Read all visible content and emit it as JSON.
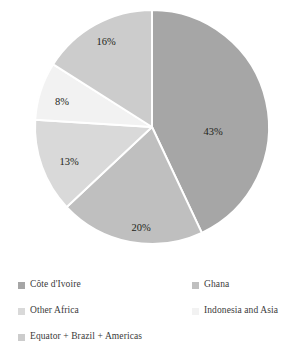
{
  "chart_data": {
    "type": "pie",
    "title": "",
    "subtitle": "",
    "xlabel": "",
    "ylabel": "",
    "grid": false,
    "legend_position": "bottom",
    "start_angle_deg": 0,
    "direction": "clockwise",
    "categories": [
      "Côte d'Ivoire",
      "Ghana",
      "Other Africa",
      "Indonesia and Asia",
      "Equator + Brazil + Americas"
    ],
    "values": [
      43,
      20,
      13,
      8,
      16
    ],
    "value_labels": [
      "43%",
      "20%",
      "13%",
      "8%",
      "16%"
    ],
    "colors": [
      "#a6a6a6",
      "#bfbfbf",
      "#d9d9d9",
      "#f2f2f2",
      "#cccccc"
    ],
    "slice_separator_color": "#ffffff",
    "units": "percent"
  },
  "pie": {
    "slices": [
      {
        "name": "Côte d'Ivoire",
        "label": "43%",
        "value": 43,
        "color": "#a6a6a6",
        "label_x": 213,
        "label_y": 133
      },
      {
        "name": "Ghana",
        "label": "20%",
        "value": 20,
        "color": "#bfbfbf",
        "label_x": 141,
        "label_y": 229
      },
      {
        "name": "Other Africa",
        "label": "13%",
        "value": 13,
        "color": "#d9d9d9",
        "label_x": 69,
        "label_y": 163
      },
      {
        "name": "Indonesia and Asia",
        "label": "8%",
        "value": 8,
        "color": "#f2f2f2",
        "label_x": 62,
        "label_y": 103
      },
      {
        "name": "Equator + Brazil + Americas",
        "label": "16%",
        "value": 16,
        "color": "#cccccc",
        "label_x": 106,
        "label_y": 43
      }
    ]
  },
  "legend": {
    "rows": [
      {
        "left": {
          "label": "Côte d'Ivoire",
          "color": "#a6a6a6"
        },
        "right": {
          "label": "Ghana",
          "color": "#bfbfbf"
        }
      },
      {
        "left": {
          "label": "Other Africa",
          "color": "#d9d9d9"
        },
        "right": {
          "label": "Indonesia and Asia",
          "color": "#f2f2f2"
        }
      },
      {
        "left": {
          "label": "Equator + Brazil + Americas",
          "color": "#cccccc"
        },
        "right": null
      }
    ]
  }
}
